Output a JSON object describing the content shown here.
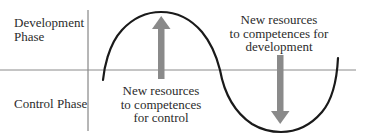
{
  "diagram": {
    "phases": {
      "development": {
        "lines": [
          "Development",
          "Phase"
        ]
      },
      "control": {
        "lines": [
          "Control Phase"
        ]
      }
    },
    "annotations": {
      "to_control": {
        "lines": [
          "New resources",
          "to competences",
          "for control"
        ],
        "arrow_direction": "up"
      },
      "to_development": {
        "lines": [
          "New resources",
          "to competences for",
          "development"
        ],
        "arrow_direction": "down"
      }
    },
    "colors": {
      "curve": "#1a1a1a",
      "axis": "#7a7a7a",
      "arrow": "#8a8a8a",
      "text": "#2b2b2b",
      "background": "#ffffff"
    }
  }
}
